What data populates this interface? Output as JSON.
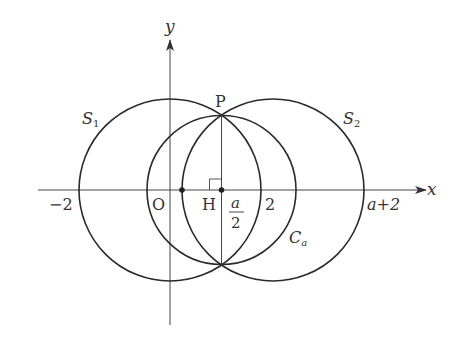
{
  "figure": {
    "type": "geometry-diagram",
    "colors": {
      "stroke": "#2a2a2a",
      "axis": "#444444",
      "text": "#333333",
      "background": "#ffffff"
    }
  },
  "axes": {
    "x_label": "x",
    "y_label": "y",
    "origin_label": "O"
  },
  "ticks": {
    "neg_two": "−2",
    "two": "2",
    "a_plus_two": "a+2",
    "a_half_num": "a",
    "a_half_den": "2"
  },
  "points": {
    "P": "P",
    "H": "H"
  },
  "curves": {
    "S1": {
      "name": "S",
      "sub": "1"
    },
    "S2": {
      "name": "S",
      "sub": "2"
    },
    "Ca": {
      "name": "C",
      "sub": "a"
    }
  }
}
